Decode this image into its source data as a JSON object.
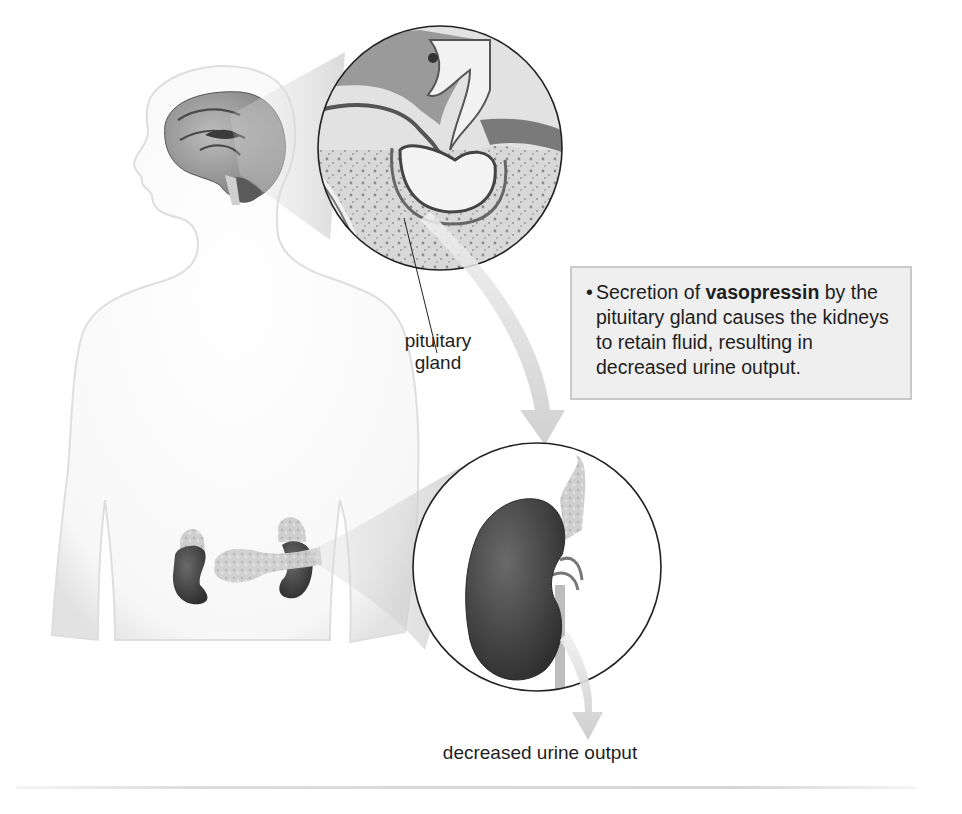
{
  "figure": {
    "callout": {
      "bullet": "•",
      "text_before": "Secretion of ",
      "bold_term": "vasopressin",
      "text_after": " by the pituitary gland causes the kidneys to retain fluid, resulting in decreased urine output."
    },
    "labels": {
      "pituitary_line1": "pituitary",
      "pituitary_line2": "gland",
      "output": "decreased urine output"
    },
    "elements": [
      {
        "name": "human-silhouette",
        "description": "Upper-body outline with head, neck, shoulders, torso"
      },
      {
        "name": "brain",
        "description": "Sagittal brain section in head"
      },
      {
        "name": "pituitary-magnified-inset",
        "description": "Circle showing pituitary gland in sella turcica"
      },
      {
        "name": "kidneys-and-pancreas",
        "description": "Two kidneys with adrenal glands and pancreas"
      },
      {
        "name": "kidney-magnified-inset",
        "description": "Circle showing magnified kidney with adrenal gland and ureter"
      },
      {
        "name": "arrow-pituitary-to-kidney",
        "description": "Curved arrow from pituitary to kidney"
      },
      {
        "name": "arrow-kidney-to-output",
        "description": "Curved arrow from kidney to urine output"
      }
    ],
    "colors": {
      "callout_bg": "#efefef",
      "callout_border": "#c9c9c9",
      "kidney": "#4a4a4a",
      "outline": "#222222"
    }
  }
}
